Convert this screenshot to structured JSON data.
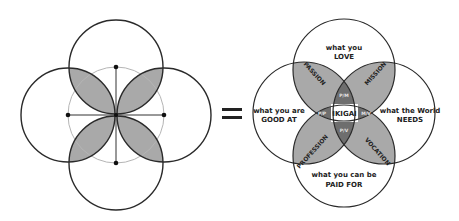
{
  "left_diagram": {
    "description": "Four overlapping circles around a central guide circle with crosshair",
    "shaded_regions": 4
  },
  "equals_sign": "=",
  "right_diagram": {
    "circles": {
      "top": {
        "line1": "what you",
        "line2": "LOVE"
      },
      "left": {
        "line1": "what you are",
        "line2": "GOOD AT"
      },
      "right": {
        "line1": "what the World",
        "line2": "NEEDS"
      },
      "bottom": {
        "line1": "what you can be",
        "line2": "PAID FOR"
      }
    },
    "overlaps": {
      "top_left": "PASSION",
      "top_right": "MISSION",
      "bottom_left": "PROFESSION",
      "bottom_right": "VOCATION"
    },
    "small_overlaps": {
      "top": "P/M",
      "left": "P/P",
      "right": "M/V",
      "bottom": "P/V"
    },
    "center": "IKIGAI"
  },
  "colors": {
    "stroke": "#2a2a2a",
    "shade": "#a9a9a9",
    "dark_shade": "#6e6e6e",
    "guide": "#b5b5b5"
  }
}
